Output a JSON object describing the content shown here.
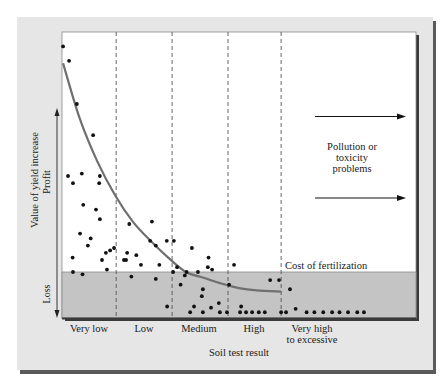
{
  "chart_data": {
    "type": "scatter",
    "title": "",
    "xlabel": "Soil test result",
    "ylabel": "Value of yield increase",
    "ylabel_upper": "Profit",
    "ylabel_lower": "Loss",
    "categories": [
      "Very low",
      "Low",
      "Medium",
      "High",
      "Very high to excessive"
    ],
    "category_labels": [
      {
        "lines": [
          "Very low"
        ]
      },
      {
        "lines": [
          "Low"
        ]
      },
      {
        "lines": [
          "Medium"
        ]
      },
      {
        "lines": [
          "High"
        ]
      },
      {
        "lines": [
          "Very high",
          "to excessive"
        ]
      }
    ],
    "grid": false,
    "legend": null,
    "axis_units": "relative (0 = cost of fertilization line; +100 = top of plot; -40 = bottom of plot)",
    "x_domain": [
      0,
      100
    ],
    "y_domain": [
      -40,
      100
    ],
    "category_boundaries": [
      15.3,
      31.1,
      46.9,
      61.9
    ],
    "cost_of_fertilization_y": 0,
    "annotations": [
      {
        "text": "Cost of fertilization",
        "x": 62.5,
        "y": 2
      },
      {
        "text": "Pollution or toxicity problems",
        "lines": [
          "Pollution or",
          "toxicity",
          "problems"
        ],
        "x": 82,
        "y": 75
      }
    ],
    "arrows": [
      {
        "from": [
          71,
          116.5
        ],
        "to": [
          97,
          116.5
        ],
        "note": "upper arrow (pixel y)"
      },
      {
        "from": [
          71,
          198
        ],
        "to": [
          97,
          198
        ],
        "note": "lower arrow (pixel y)"
      }
    ],
    "series": [
      {
        "name": "Response curve",
        "kind": "line",
        "x": [
          0.3,
          5,
          10,
          15,
          20,
          25,
          30,
          35,
          40,
          45,
          50,
          55,
          61.9
        ],
        "y": [
          87,
          64,
          46,
          32,
          21,
          13,
          6,
          0,
          -5,
          -10,
          -14,
          -16,
          -17
        ]
      },
      {
        "name": "Observed yield response",
        "kind": "scatter",
        "points": [
          [
            0.3,
            94
          ],
          [
            2,
            88
          ],
          [
            4.2,
            70
          ],
          [
            8.8,
            57
          ],
          [
            1.7,
            40
          ],
          [
            5.6,
            41
          ],
          [
            10.7,
            40
          ],
          [
            3,
            6
          ],
          [
            7.3,
            11
          ],
          [
            14.7,
            10
          ],
          [
            10.5,
            37
          ],
          [
            6,
            28
          ],
          [
            10.7,
            22
          ],
          [
            11.3,
            5
          ],
          [
            5.1,
            16
          ],
          [
            3.1,
            0
          ],
          [
            3.1,
            37
          ],
          [
            9.6,
            26
          ],
          [
            8.1,
            14
          ],
          [
            12.4,
            8
          ],
          [
            13.6,
            9
          ],
          [
            5.8,
            -2
          ],
          [
            12.7,
            1
          ],
          [
            19,
            20
          ],
          [
            25.4,
            21
          ],
          [
            24.9,
            13
          ],
          [
            18.4,
            8
          ],
          [
            18.1,
            5
          ],
          [
            22.3,
            3
          ],
          [
            21,
            7
          ],
          [
            27.5,
            3
          ],
          [
            19.6,
            -4
          ],
          [
            17.5,
            5
          ],
          [
            32.5,
            2
          ],
          [
            31.6,
            13
          ],
          [
            26.5,
            11
          ],
          [
            29.6,
            13
          ],
          [
            36.7,
            10
          ],
          [
            41.4,
            6
          ],
          [
            34.7,
            -3
          ],
          [
            38.4,
            0
          ],
          [
            42.4,
            1
          ],
          [
            31.4,
            0
          ],
          [
            35.2,
            0
          ],
          [
            26.5,
            -6
          ],
          [
            33.5,
            -11
          ],
          [
            39.8,
            -15
          ],
          [
            41.2,
            2
          ],
          [
            48.6,
            3
          ],
          [
            47.2,
            -11
          ],
          [
            39.5,
            -21
          ],
          [
            44.3,
            -27
          ],
          [
            37.3,
            -30
          ],
          [
            42.1,
            -31
          ],
          [
            50.6,
            -30
          ],
          [
            29.7,
            -30
          ],
          [
            36.2,
            -35
          ],
          [
            39.8,
            -35
          ],
          [
            44.6,
            -35
          ],
          [
            46.6,
            -35
          ],
          [
            50.3,
            -35
          ],
          [
            52,
            -35
          ],
          [
            53.7,
            -35
          ],
          [
            55.6,
            -35
          ],
          [
            57.3,
            -35
          ],
          [
            61.9,
            -35
          ],
          [
            58.8,
            -7
          ],
          [
            61.3,
            -7
          ],
          [
            66,
            -32
          ],
          [
            63.3,
            -35
          ],
          [
            69.1,
            -35
          ],
          [
            71.3,
            -35
          ],
          [
            73.8,
            -35
          ],
          [
            76.3,
            -35
          ],
          [
            78.4,
            -35
          ],
          [
            80.8,
            -35
          ],
          [
            83.4,
            -35
          ],
          [
            85.3,
            -35
          ],
          [
            64.4,
            -15
          ]
        ]
      }
    ]
  },
  "figure": {
    "panel_bg": "#e6e6e6",
    "plot_bg": "#ffffff",
    "loss_band": "#c4c4c4",
    "curve_color": "#6f6f6f",
    "dot_color": "#111111",
    "frame_color": "#4a4a4a"
  }
}
